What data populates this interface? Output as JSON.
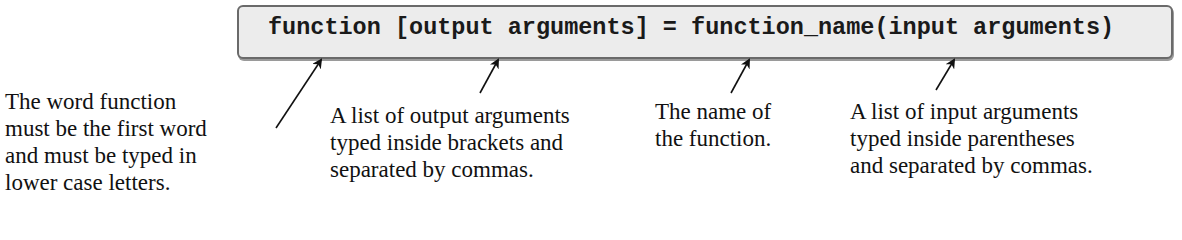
{
  "syntax": {
    "code": "function [output arguments] = function_name(input arguments)"
  },
  "annotations": [
    {
      "id": "keyword",
      "lines": [
        "The word function",
        "must be the first word",
        "and must be typed in",
        "lower case letters."
      ]
    },
    {
      "id": "output-args",
      "lines": [
        "A list of output arguments",
        "typed inside brackets and",
        "separated by commas."
      ]
    },
    {
      "id": "function-name",
      "lines": [
        "The name of",
        "the function."
      ]
    },
    {
      "id": "input-args",
      "lines": [
        "A list of input arguments",
        "typed inside parentheses",
        "and separated by commas."
      ]
    }
  ],
  "colors": {
    "box_fill": "#ececec",
    "box_border": "#6a6a6a",
    "text": "#111111"
  }
}
